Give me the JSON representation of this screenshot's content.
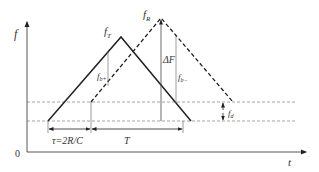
{
  "diagram": {
    "type": "FMCW triangular-modulation frequency-time diagram",
    "axes": {
      "y_label": "f",
      "x_label": "t",
      "origin_label": "0"
    },
    "signals": [
      {
        "name": "transmitted",
        "label": "f",
        "label_sub": "T",
        "style": "solid",
        "color": "#222222"
      },
      {
        "name": "received",
        "label": "f",
        "label_sub": "R",
        "style": "dashed",
        "color": "#222222"
      }
    ],
    "annotations": {
      "delta_f": "ΔF",
      "beat_up": {
        "base": "f",
        "sub": "b+"
      },
      "beat_down": {
        "base": "f",
        "sub": "b−"
      },
      "doppler": {
        "base": "f",
        "sub": "d"
      },
      "tau": "τ=2R/C",
      "period": "T"
    },
    "colors": {
      "line": "#222222",
      "guide": "#555555",
      "thin": "#777777",
      "text": "#333333"
    }
  }
}
